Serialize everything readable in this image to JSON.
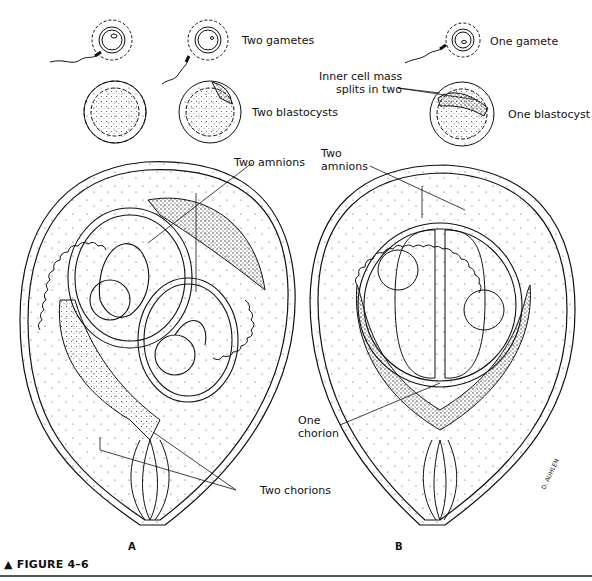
{
  "figure": {
    "caption_marker": "▲",
    "caption": "FIGURE 4–6",
    "panels": [
      {
        "id": "A",
        "letter": "A"
      },
      {
        "id": "B",
        "letter": "B"
      }
    ]
  },
  "labels": {
    "two_gametes": "Two gametes",
    "two_blastocysts": "Two blastocysts",
    "one_gamete": "One gamete",
    "inner_cell_mass_line1": "Inner cell mass",
    "inner_cell_mass_line2": "splits in two",
    "one_blastocyst": "One blastocyst",
    "two_amnions_a": "Two amnions",
    "two_amnions_b_line1": "Two",
    "two_amnions_b_line2": "amnions",
    "one_chorion_line1": "One",
    "one_chorion_line2": "chorion",
    "two_chorions": "Two chorions"
  },
  "signature": "D. AUHLEN",
  "colors": {
    "ink": "#111111",
    "background": "#ffffff",
    "rule": "#555555"
  }
}
